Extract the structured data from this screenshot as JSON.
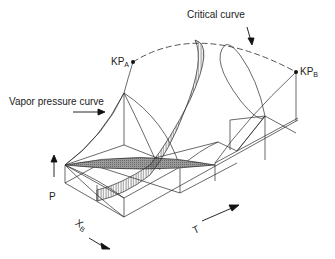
{
  "diagram": {
    "labels": {
      "critical_curve": "Critical curve",
      "vapor_pressure_curve": "Vapor pressure curve",
      "kp_a_main": "KP",
      "kp_a_sub": "A",
      "kp_b_main": "KP",
      "kp_b_sub": "B",
      "p_axis": "P",
      "x_axis_main": "X",
      "x_axis_sub": "B",
      "t_axis": "T"
    },
    "colors": {
      "line": "#2a2a2a",
      "shade": "#8a8a8a",
      "background": "#ffffff"
    }
  }
}
